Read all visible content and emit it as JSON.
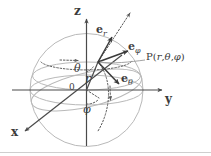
{
  "figure": {
    "colors": {
      "axis": "#4a4a4a",
      "sphere": "#b9b9b9",
      "vector": "#3a3a3a",
      "dotted": "#5a5a5a",
      "text": "#3b3b3b",
      "background": "#ffffff",
      "artifact": "#cfcfcf"
    },
    "axes": [
      {
        "name": "z-axis",
        "label": "z",
        "direction": "up"
      },
      {
        "name": "y-axis",
        "label": "y",
        "direction": "right"
      },
      {
        "name": "x-axis",
        "label": "x",
        "direction": "lower-left"
      }
    ],
    "origin_label": "0",
    "point": {
      "label_prefix": "P",
      "label_open": "(",
      "label_r": "r",
      "label_sep1": ",",
      "label_theta": "θ",
      "label_sep2": ",",
      "label_phi": "φ",
      "label_close": ")",
      "full_label": "P(r, θ, φ)"
    },
    "unit_vectors": [
      {
        "name": "e-r",
        "base": "e",
        "sub": "r",
        "label": "e_r"
      },
      {
        "name": "e-phi",
        "base": "e",
        "sub": "φ",
        "label": "e_φ"
      },
      {
        "name": "e-theta",
        "base": "e",
        "sub": "θ",
        "label": "e_θ"
      }
    ],
    "angles": [
      {
        "name": "theta-angle",
        "label": "θ",
        "description": "polar angle from z-axis"
      },
      {
        "name": "phi-angle",
        "label": "φ",
        "description": "azimuthal angle in xy-plane"
      }
    ],
    "radius": {
      "name": "radius",
      "label": "r"
    }
  }
}
